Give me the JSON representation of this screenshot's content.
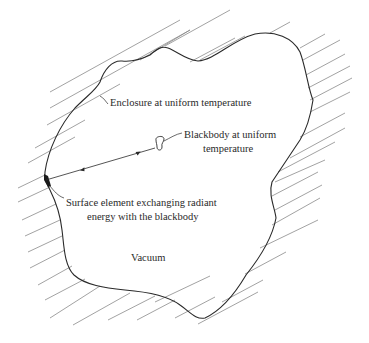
{
  "diagram": {
    "type": "radiation-enclosure-schematic",
    "labels": {
      "enclosure": "Enclosure at uniform temperature",
      "blackbody_line1": "Blackbody at uniform",
      "blackbody_line2": "temperature",
      "surface_line1": "Surface element exchanging radiant",
      "surface_line2": "energy with the blackbody",
      "vacuum": "Vacuum"
    },
    "colors": {
      "outline": "#2a2a2a",
      "hatch": "#8a8a8a",
      "background": "#ffffff"
    }
  }
}
